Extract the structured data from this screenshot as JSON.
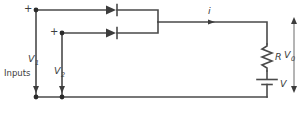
{
  "figure": {
    "type": "circuit-schematic",
    "name": "diode-or-gate",
    "width": 307,
    "height": 113,
    "background_color": "#ffffff",
    "line_color": "#4a4a4a",
    "text_color": "#3d3d3d"
  },
  "labels": {
    "inputs_group": "Inputs",
    "input1_voltage": "V",
    "input1_subscript": "1",
    "input2_voltage": "V",
    "input2_subscript": "2",
    "input1_polarity": "+",
    "input2_polarity": "+",
    "current": "i",
    "resistor": "R",
    "source": "V",
    "output_voltage": "V",
    "output_subscript": "0"
  },
  "components": [
    {
      "name": "diode-1",
      "type": "diode",
      "orientation": "left-to-right",
      "label": ""
    },
    {
      "name": "diode-2",
      "type": "diode",
      "orientation": "left-to-right",
      "label": ""
    },
    {
      "name": "resistor-R",
      "type": "resistor",
      "orientation": "vertical",
      "label": "R"
    },
    {
      "name": "battery-V",
      "type": "battery",
      "orientation": "vertical",
      "label": "V"
    }
  ],
  "annotations": [
    {
      "name": "current-arrow-i",
      "label": "i",
      "direction": "right"
    },
    {
      "name": "output-arrow-v0",
      "label": "V0",
      "direction": "double-vertical"
    },
    {
      "name": "input-arrow-v1",
      "label": "V1",
      "direction": "down"
    },
    {
      "name": "input-arrow-v2",
      "label": "V2",
      "direction": "down"
    }
  ]
}
